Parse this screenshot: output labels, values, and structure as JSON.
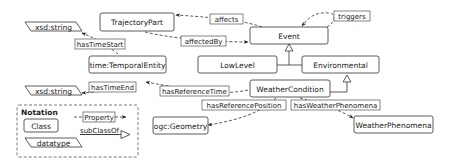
{
  "diagram": {
    "classes": {
      "trajectory_part": "TrajectoryPart",
      "event": "Event",
      "temporal_entity": "time:TemporalEntity",
      "low_level": "LowLevel",
      "environmental": "Environmental",
      "weather_condition": "WeatherCondition",
      "geometry": "ogc:Geometry",
      "weather_phenomena": "WeatherPhenomena"
    },
    "datatypes": {
      "start_string": "xsd:string",
      "end_string": "xsd:string"
    },
    "properties": {
      "affects": "affects",
      "affected_by": "affectedBy",
      "triggers": "triggers",
      "has_time_start": "hasTimeStart",
      "has_time_end": "hasTimeEnd",
      "has_reference_time": "hasReferenceTime",
      "has_reference_position": "hasReferencePosition",
      "has_weather_phenomena": "hasWeatherPhenomena"
    },
    "notation": {
      "title": "Notation",
      "class": "Class",
      "property": "Property",
      "subclass_of": "subClassOf",
      "datatype": "datatype"
    }
  }
}
